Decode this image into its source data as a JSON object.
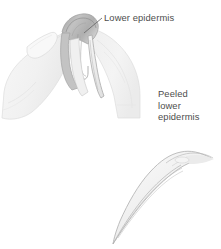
{
  "figure": {
    "background_color": "#ffffff",
    "width": 221,
    "height": 249,
    "title_alt": "Peeling the lower epidermis from a leaf between two fingers"
  },
  "annotations": [
    {
      "id": "lower-epidermis",
      "text": "Lower epidermis",
      "lines": [
        "Lower epidermis"
      ],
      "text_color": "#4d4d4d",
      "leader": {
        "style": "diagonal",
        "from_x": 102,
        "from_y": 18,
        "to_x": 84,
        "to_y": 33,
        "color": "#6e6e6e"
      }
    },
    {
      "id": "peeled-lower-epidermis",
      "text": "Peeled lower epidermis",
      "lines": [
        "Peeled",
        "lower",
        "epidermis"
      ],
      "text_color": "#4d4d4d",
      "leader": {
        "style": "vertical",
        "from_x": 182,
        "from_y": 128,
        "to_x": 182,
        "to_y": 159,
        "color": "#8a8a8a"
      }
    }
  ],
  "illustration": {
    "parts": [
      {
        "name": "left-finger",
        "description": "Left index finger with fingernail gripping the leaf",
        "fill": "#f4f4f4",
        "stroke": "#dcdcdc"
      },
      {
        "name": "right-finger",
        "description": "Right index finger gripping the opposite side of the leaf",
        "fill": "#f2f2f2",
        "stroke": "#d8d8d8"
      },
      {
        "name": "leaf-fold",
        "description": "Folded darker grey leaf edge held between the fingers",
        "fill": "#b6b6b6",
        "stroke": "#9a9a9a"
      },
      {
        "name": "hanging-epidermis-strips",
        "description": "Two translucent strips of lower epidermis hanging between the fingers",
        "fill": "#ededed",
        "stroke": "#9d9d9d"
      },
      {
        "name": "peeled-strip",
        "description": "Detached curved translucent strip of peeled lower epidermis tapering to a point",
        "fill": "#f3f3f3",
        "stroke": "#a8a8a8"
      }
    ],
    "palette": {
      "background": "#ffffff",
      "pale_fill": "#f4f4f4",
      "mid_grey": "#b6b6b6",
      "outline": "#b0b0b0",
      "text": "#4d4d4d",
      "leader": "#6e6e6e"
    }
  }
}
